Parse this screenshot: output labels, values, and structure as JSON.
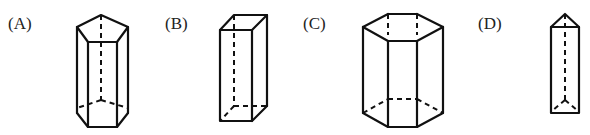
{
  "diagram": {
    "type": "multiple-choice figure options",
    "options": [
      {
        "label": "(A)",
        "shape": "pentagonal prism"
      },
      {
        "label": "(B)",
        "shape": "rectangular prism"
      },
      {
        "label": "(C)",
        "shape": "hexagonal prism"
      },
      {
        "label": "(D)",
        "shape": "triangular prism"
      }
    ]
  },
  "colors": {
    "line": "#111111",
    "background": "#ffffff",
    "label": "#222222"
  }
}
